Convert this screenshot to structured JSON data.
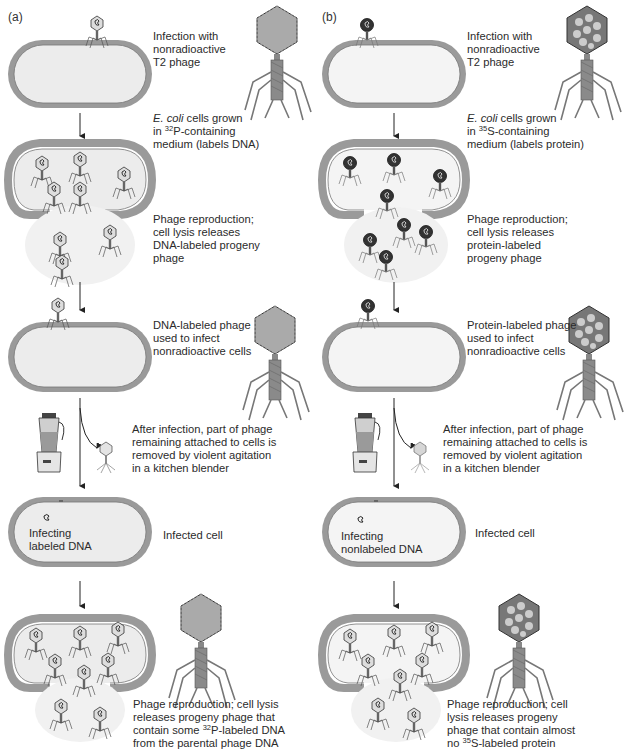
{
  "figure": {
    "panels": [
      {
        "label": "(a)",
        "isotope": "32P",
        "steps": [
          {
            "id": "infection",
            "text_lines": [
              "Infection with",
              "nonradioactive",
              "T2 phage"
            ]
          },
          {
            "id": "growth",
            "text_italic": "E. coli",
            "text_lines": [
              " cells grown",
              "in ",
              "-containing",
              "medium (labels DNA)"
            ],
            "isotope_mass": "32",
            "isotope_symbol": "P"
          },
          {
            "id": "reproduction",
            "text_lines": [
              "Phage reproduction;",
              "cell lysis releases",
              "DNA-labeled progeny",
              "phage"
            ]
          },
          {
            "id": "reinfect",
            "text_lines": [
              "DNA-labeled phage",
              "used to infect",
              "nonradioactive cells"
            ]
          },
          {
            "id": "blender",
            "text_lines": [
              "After infection, part of phage",
              "remaining attached to cells is",
              "removed by violent agitation",
              "in a kitchen blender"
            ]
          },
          {
            "id": "infected",
            "inner_lines": [
              "Infecting",
              "labeled DNA"
            ],
            "side_text": "Infected cell"
          },
          {
            "id": "result",
            "text_lines": [
              "Phage reproduction; cell lysis",
              "releases progeny phage that",
              "contain some ",
              "-labeled DNA",
              "from the parental phage DNA"
            ],
            "isotope_mass": "32",
            "isotope_symbol": "P"
          }
        ]
      },
      {
        "label": "(b)",
        "isotope": "35S",
        "steps": [
          {
            "id": "infection",
            "text_lines": [
              "Infection with",
              "nonradioactive",
              "T2 phage"
            ]
          },
          {
            "id": "growth",
            "text_italic": "E. coli",
            "text_lines": [
              " cells grown",
              "in ",
              "-containing",
              "medium (labels protein)"
            ],
            "isotope_mass": "35",
            "isotope_symbol": "S"
          },
          {
            "id": "reproduction",
            "text_lines": [
              "Phage reproduction;",
              "cell lysis releases",
              "protein-labeled",
              "progeny phage"
            ]
          },
          {
            "id": "reinfect",
            "text_lines": [
              "Protein-labeled phage",
              "used to infect",
              "nonradioactive cells"
            ]
          },
          {
            "id": "blender",
            "text_lines": [
              "After infection, part of phage",
              "remaining attached to cells is",
              "removed by violent agitation",
              "in a kitchen blender"
            ]
          },
          {
            "id": "infected",
            "inner_lines": [
              "Infecting",
              "nonlabeled DNA"
            ],
            "side_text": "Infected cell"
          },
          {
            "id": "result",
            "text_lines": [
              "Phage reproduction; cell",
              "lysis releases progeny",
              "phage that contain almost",
              "no ",
              "-labeled protein"
            ],
            "isotope_mass": "35",
            "isotope_symbol": "S"
          }
        ]
      }
    ],
    "colors": {
      "cell_wall": "#9a9a9a",
      "cell_inner": "#ececec",
      "line": "#333333",
      "phage_body": "#555555"
    },
    "icons": [
      "t2-phage-icon",
      "e-coli-cell-icon",
      "blender-icon",
      "arrow-down-icon"
    ]
  }
}
